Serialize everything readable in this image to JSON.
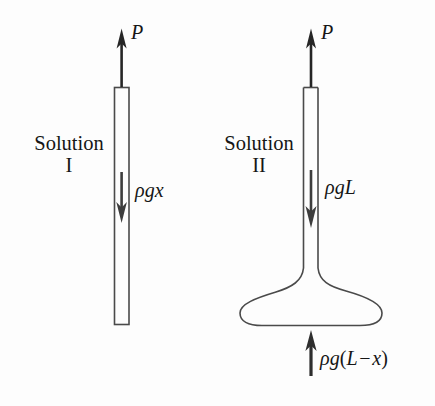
{
  "figure": {
    "background_color": "#fdfdfd",
    "ink_color": "#1a1a1a",
    "width": 435,
    "height": 406,
    "panels": [
      {
        "id": "solution-1",
        "caption_line1": "Solution",
        "caption_line2": "I",
        "shape": "straight-rod",
        "top_force_label": "P",
        "body_force_label": "ρgx",
        "bottom_force_label": null
      },
      {
        "id": "solution-2",
        "caption_line1": "Solution",
        "caption_line2": "II",
        "shape": "rod-with-flared-bulb",
        "top_force_label": "P",
        "body_force_label": "ρgL",
        "bottom_force_label": {
          "prefix": "ρg",
          "open_paren": "(",
          "first_term": "L",
          "operator": "−",
          "second_term": "x",
          "close_paren": ")",
          "full": "ρg(L − x)"
        }
      }
    ]
  },
  "arrows": {
    "up_top_1": "force-arrow-up-P-solution-1",
    "down_1": "force-arrow-down-rho-g-x",
    "up_top_2": "force-arrow-up-P-solution-2",
    "down_2": "force-arrow-down-rho-g-L",
    "up_bottom_2": "force-arrow-up-rho-g-L-minus-x"
  }
}
